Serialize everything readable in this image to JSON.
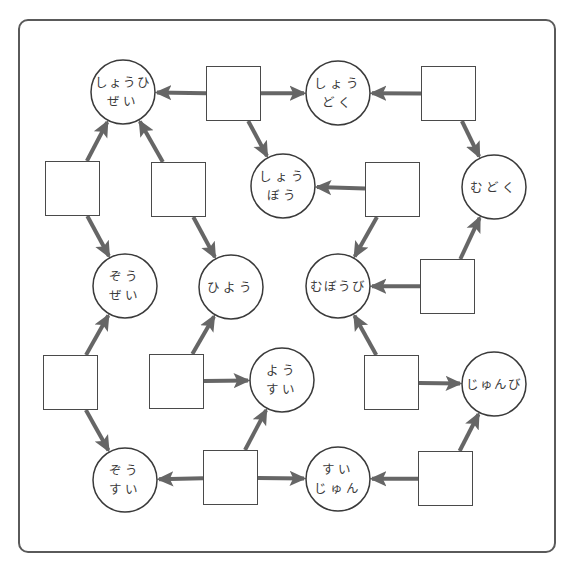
{
  "diagram": {
    "title": "",
    "colors": {
      "frame": "#5a5a5a",
      "arrow": "#666666",
      "shape_stroke": "#3a3a3a",
      "text": "#3a3a3a"
    },
    "words": [
      {
        "id": "shouhizei",
        "lines": [
          "しょうひ",
          "ぜい"
        ],
        "cx": 123,
        "cy": 92
      },
      {
        "id": "shoudoku",
        "lines": [
          "しょう",
          "どく"
        ],
        "cx": 338,
        "cy": 93
      },
      {
        "id": "mudoku",
        "lines": [
          "むどく"
        ],
        "cx": 494,
        "cy": 187
      },
      {
        "id": "shoubou",
        "lines": [
          "しょう",
          "ぼう"
        ],
        "cx": 283,
        "cy": 186
      },
      {
        "id": "zouzei",
        "lines": [
          "ぞう",
          "ぜい"
        ],
        "cx": 125,
        "cy": 286
      },
      {
        "id": "hiyou",
        "lines": [
          "ひよう"
        ],
        "cx": 231,
        "cy": 287
      },
      {
        "id": "mubou-bi",
        "lines": [
          "むぼうび"
        ],
        "cx": 338,
        "cy": 286
      },
      {
        "id": "yousui",
        "lines": [
          "よう",
          "すい"
        ],
        "cx": 282,
        "cy": 380
      },
      {
        "id": "junbi",
        "lines": [
          "じゅんび"
        ],
        "cx": 494,
        "cy": 384
      },
      {
        "id": "zousui",
        "lines": [
          "ぞう",
          "すい"
        ],
        "cx": 125,
        "cy": 480
      },
      {
        "id": "suijun",
        "lines": [
          "すい",
          "じゅん"
        ],
        "cx": 338,
        "cy": 479
      }
    ],
    "blank_boxes": [
      {
        "id": "box-1",
        "x": 206,
        "y": 66,
        "value": ""
      },
      {
        "id": "box-2",
        "x": 421,
        "y": 66,
        "value": ""
      },
      {
        "id": "box-3",
        "x": 45,
        "y": 161,
        "value": ""
      },
      {
        "id": "box-4",
        "x": 151,
        "y": 162,
        "value": ""
      },
      {
        "id": "box-5",
        "x": 365,
        "y": 162,
        "value": ""
      },
      {
        "id": "box-6",
        "x": 420,
        "y": 259,
        "value": ""
      },
      {
        "id": "box-7",
        "x": 43,
        "y": 355,
        "value": ""
      },
      {
        "id": "box-8",
        "x": 149,
        "y": 354,
        "value": ""
      },
      {
        "id": "box-9",
        "x": 364,
        "y": 355,
        "value": ""
      },
      {
        "id": "box-10",
        "x": 203,
        "y": 450,
        "value": ""
      },
      {
        "id": "box-11",
        "x": 418,
        "y": 451,
        "value": ""
      }
    ],
    "box_size": 55,
    "circle_radius": 32,
    "arrows": [
      {
        "from": "box-1",
        "to": "shouhizei"
      },
      {
        "from": "box-1",
        "to": "shoudoku"
      },
      {
        "from": "box-1",
        "to": "shoubou"
      },
      {
        "from": "box-2",
        "to": "shoudoku"
      },
      {
        "from": "box-2",
        "to": "mudoku"
      },
      {
        "from": "box-3",
        "to": "shouhizei"
      },
      {
        "from": "box-3",
        "to": "zouzei"
      },
      {
        "from": "box-4",
        "to": "shouhizei"
      },
      {
        "from": "box-4",
        "to": "hiyou"
      },
      {
        "from": "box-5",
        "to": "shoubou"
      },
      {
        "from": "box-5",
        "to": "mubou-bi"
      },
      {
        "from": "box-6",
        "to": "mubou-bi"
      },
      {
        "from": "box-6",
        "to": "mudoku"
      },
      {
        "from": "box-7",
        "to": "zouzei"
      },
      {
        "from": "box-7",
        "to": "zousui"
      },
      {
        "from": "box-8",
        "to": "hiyou"
      },
      {
        "from": "box-8",
        "to": "yousui"
      },
      {
        "from": "box-9",
        "to": "mubou-bi"
      },
      {
        "from": "box-9",
        "to": "junbi"
      },
      {
        "from": "box-10",
        "to": "zousui"
      },
      {
        "from": "box-10",
        "to": "yousui"
      },
      {
        "from": "box-10",
        "to": "suijun"
      },
      {
        "from": "box-11",
        "to": "suijun"
      },
      {
        "from": "box-11",
        "to": "junbi"
      }
    ]
  }
}
